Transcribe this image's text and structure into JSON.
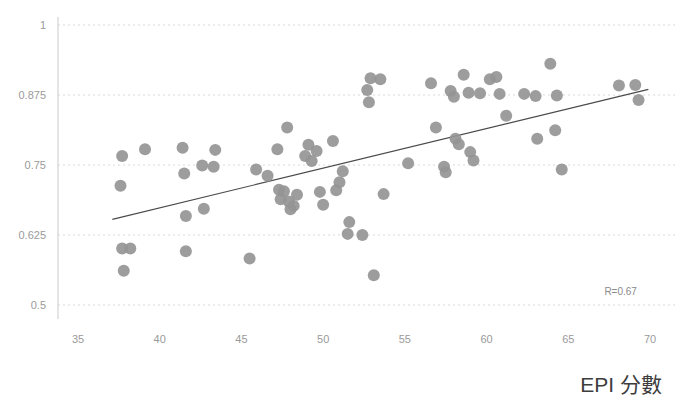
{
  "chart_data": {
    "type": "scatter",
    "title": "",
    "xlabel": "EPI 分數",
    "ylabel": "",
    "xlim": [
      35,
      70
    ],
    "ylim": [
      0.5,
      1.0
    ],
    "xticks": [
      35,
      40,
      45,
      50,
      55,
      60,
      65,
      70
    ],
    "xtick_labels": [
      "35",
      "40",
      "45",
      "50",
      "55",
      "60",
      "65",
      "70"
    ],
    "yticks": [
      0.5,
      0.625,
      0.75,
      0.875,
      1
    ],
    "ytick_labels": [
      "0.5",
      "0.625",
      "0.75",
      "0.875",
      "1"
    ],
    "grid": "horizontal-dotted",
    "legend": "none",
    "annotations": [
      {
        "text": "R=0.67",
        "x": 69.2,
        "y": 0.517
      }
    ],
    "trendline": {
      "type": "linear",
      "x_start": 37.1,
      "y_start": 0.653,
      "x_end": 69.9,
      "y_end": 0.885,
      "color": "#4a4a4a"
    },
    "marker": {
      "shape": "circle",
      "radius_px": 6,
      "color": "#959595",
      "opacity": 0.92
    },
    "points": [
      {
        "x": 37.7,
        "y": 0.766
      },
      {
        "x": 37.6,
        "y": 0.713
      },
      {
        "x": 37.7,
        "y": 0.601
      },
      {
        "x": 38.2,
        "y": 0.601
      },
      {
        "x": 37.8,
        "y": 0.561
      },
      {
        "x": 39.1,
        "y": 0.778
      },
      {
        "x": 41.4,
        "y": 0.781
      },
      {
        "x": 41.5,
        "y": 0.735
      },
      {
        "x": 41.6,
        "y": 0.659
      },
      {
        "x": 41.6,
        "y": 0.596
      },
      {
        "x": 42.6,
        "y": 0.749
      },
      {
        "x": 42.7,
        "y": 0.672
      },
      {
        "x": 43.4,
        "y": 0.777
      },
      {
        "x": 43.3,
        "y": 0.747
      },
      {
        "x": 45.5,
        "y": 0.583
      },
      {
        "x": 45.9,
        "y": 0.742
      },
      {
        "x": 46.6,
        "y": 0.731
      },
      {
        "x": 47.2,
        "y": 0.778
      },
      {
        "x": 47.3,
        "y": 0.706
      },
      {
        "x": 47.4,
        "y": 0.689
      },
      {
        "x": 47.6,
        "y": 0.703
      },
      {
        "x": 47.8,
        "y": 0.817
      },
      {
        "x": 47.9,
        "y": 0.685
      },
      {
        "x": 48.0,
        "y": 0.671
      },
      {
        "x": 48.2,
        "y": 0.677
      },
      {
        "x": 48.4,
        "y": 0.697
      },
      {
        "x": 48.9,
        "y": 0.766
      },
      {
        "x": 49.1,
        "y": 0.786
      },
      {
        "x": 49.3,
        "y": 0.757
      },
      {
        "x": 49.6,
        "y": 0.775
      },
      {
        "x": 49.8,
        "y": 0.702
      },
      {
        "x": 50.0,
        "y": 0.679
      },
      {
        "x": 50.6,
        "y": 0.793
      },
      {
        "x": 50.8,
        "y": 0.705
      },
      {
        "x": 51.0,
        "y": 0.719
      },
      {
        "x": 51.2,
        "y": 0.739
      },
      {
        "x": 51.5,
        "y": 0.627
      },
      {
        "x": 51.6,
        "y": 0.648
      },
      {
        "x": 52.4,
        "y": 0.625
      },
      {
        "x": 52.7,
        "y": 0.884
      },
      {
        "x": 52.8,
        "y": 0.862
      },
      {
        "x": 52.9,
        "y": 0.905
      },
      {
        "x": 53.1,
        "y": 0.553
      },
      {
        "x": 53.5,
        "y": 0.903
      },
      {
        "x": 53.7,
        "y": 0.698
      },
      {
        "x": 55.2,
        "y": 0.753
      },
      {
        "x": 56.6,
        "y": 0.896
      },
      {
        "x": 56.9,
        "y": 0.817
      },
      {
        "x": 57.4,
        "y": 0.747
      },
      {
        "x": 57.5,
        "y": 0.737
      },
      {
        "x": 57.8,
        "y": 0.882
      },
      {
        "x": 58.0,
        "y": 0.872
      },
      {
        "x": 58.1,
        "y": 0.797
      },
      {
        "x": 58.3,
        "y": 0.787
      },
      {
        "x": 58.6,
        "y": 0.911
      },
      {
        "x": 58.9,
        "y": 0.879
      },
      {
        "x": 59.0,
        "y": 0.773
      },
      {
        "x": 59.2,
        "y": 0.758
      },
      {
        "x": 59.6,
        "y": 0.878
      },
      {
        "x": 60.2,
        "y": 0.903
      },
      {
        "x": 60.6,
        "y": 0.907
      },
      {
        "x": 60.8,
        "y": 0.877
      },
      {
        "x": 61.2,
        "y": 0.838
      },
      {
        "x": 62.3,
        "y": 0.877
      },
      {
        "x": 63.0,
        "y": 0.873
      },
      {
        "x": 63.1,
        "y": 0.797
      },
      {
        "x": 63.9,
        "y": 0.931
      },
      {
        "x": 64.3,
        "y": 0.874
      },
      {
        "x": 64.2,
        "y": 0.812
      },
      {
        "x": 64.6,
        "y": 0.742
      },
      {
        "x": 68.1,
        "y": 0.892
      },
      {
        "x": 69.1,
        "y": 0.893
      },
      {
        "x": 69.3,
        "y": 0.866
      }
    ]
  },
  "axes": {
    "x_axis_label": "EPI 分數",
    "y_axis_label": ""
  }
}
